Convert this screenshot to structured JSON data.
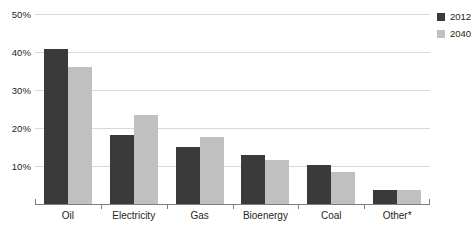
{
  "chart_data": {
    "type": "bar",
    "title": "",
    "subtitle": "",
    "xlabel": "",
    "ylabel": "",
    "categories": [
      "Oil",
      "Electricity",
      "Gas",
      "Bioenergy",
      "Coal",
      "Other*"
    ],
    "series": [
      {
        "name": "2012",
        "color": "#3a3a3a",
        "values": [
          40.8,
          18.2,
          15.0,
          12.9,
          10.3,
          3.7
        ]
      },
      {
        "name": "2040",
        "color": "#c0c0c0",
        "values": [
          36.0,
          23.3,
          17.6,
          11.6,
          8.4,
          3.6
        ]
      }
    ],
    "ylim": [
      0,
      50
    ],
    "yticks": [
      50,
      40,
      30,
      20,
      10
    ],
    "ytick_labels": [
      "50%",
      "40%",
      "30%",
      "20%",
      "10%"
    ],
    "grid": true,
    "legend_position": "right-top",
    "value_suffix": "%"
  },
  "legend": {
    "items": [
      {
        "label": "2012",
        "swatch": "#3a3a3a"
      },
      {
        "label": "2040",
        "swatch": "#c0c0c0"
      }
    ]
  }
}
